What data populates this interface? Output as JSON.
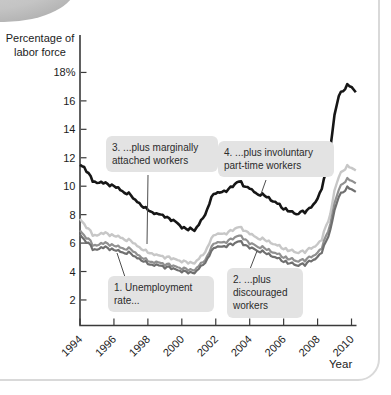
{
  "figure": {
    "kind": "textbook-line-chart"
  },
  "chart_data": {
    "type": "line",
    "title": "",
    "ylabel": "Percentage of labor force",
    "xlabel": "Year",
    "xlim": [
      1994,
      2010.5
    ],
    "ylim": [
      0,
      19
    ],
    "grid": false,
    "legend_position": "annotated-callouts",
    "x_ticks": [
      1994,
      1996,
      1998,
      2000,
      2002,
      2004,
      2006,
      2008,
      2010
    ],
    "x_tick_labels": [
      "1994",
      "1996",
      "1998",
      "2000",
      "2002",
      "2004",
      "2006",
      "2008",
      "2010"
    ],
    "y_ticks": [
      2,
      4,
      6,
      8,
      10,
      12,
      14,
      16,
      18
    ],
    "y_tick_labels": [
      "2",
      "4",
      "6",
      "8",
      "10",
      "12",
      "14",
      "16",
      "18%"
    ],
    "x": [
      1994.0,
      1994.25,
      1994.5,
      1994.75,
      1995.0,
      1995.25,
      1995.5,
      1995.75,
      1996.0,
      1996.25,
      1996.5,
      1996.75,
      1997.0,
      1997.25,
      1997.5,
      1997.75,
      1998.0,
      1998.25,
      1998.5,
      1998.75,
      1999.0,
      1999.25,
      1999.5,
      1999.75,
      2000.0,
      2000.25,
      2000.5,
      2000.75,
      2001.0,
      2001.25,
      2001.5,
      2001.75,
      2002.0,
      2002.25,
      2002.5,
      2002.75,
      2003.0,
      2003.25,
      2003.5,
      2003.75,
      2004.0,
      2004.25,
      2004.5,
      2004.75,
      2005.0,
      2005.25,
      2005.5,
      2005.75,
      2006.0,
      2006.25,
      2006.5,
      2006.75,
      2007.0,
      2007.25,
      2007.5,
      2007.75,
      2008.0,
      2008.25,
      2008.5,
      2008.75,
      2009.0,
      2009.25,
      2009.5,
      2009.75,
      2010.0,
      2010.25
    ],
    "series": [
      {
        "name": "1. Unemployment rate...",
        "color": "#6f6f6f",
        "values": [
          6.6,
          6.2,
          6.0,
          5.6,
          5.5,
          5.7,
          5.7,
          5.6,
          5.5,
          5.5,
          5.3,
          5.3,
          5.3,
          5.0,
          4.9,
          4.7,
          4.6,
          4.4,
          4.5,
          4.4,
          4.3,
          4.3,
          4.2,
          4.1,
          4.0,
          4.0,
          3.9,
          3.9,
          4.2,
          4.5,
          4.8,
          5.5,
          5.7,
          5.8,
          5.7,
          5.9,
          5.9,
          6.1,
          6.1,
          5.8,
          5.7,
          5.6,
          5.4,
          5.4,
          5.3,
          5.1,
          5.0,
          4.9,
          4.7,
          4.6,
          4.6,
          4.4,
          4.5,
          4.5,
          4.7,
          4.8,
          5.0,
          5.4,
          6.1,
          6.9,
          8.3,
          9.3,
          9.6,
          9.9,
          9.8,
          9.6
        ]
      },
      {
        "name": "2. ...plus discouraged workers",
        "color": "#909090",
        "values": [
          6.9,
          6.5,
          6.3,
          5.9,
          5.8,
          6.0,
          6.0,
          5.9,
          5.8,
          5.8,
          5.6,
          5.6,
          5.6,
          5.3,
          5.1,
          4.9,
          4.8,
          4.6,
          4.7,
          4.6,
          4.5,
          4.5,
          4.4,
          4.3,
          4.2,
          4.2,
          4.1,
          4.1,
          4.4,
          4.7,
          5.0,
          5.8,
          6.0,
          6.1,
          6.0,
          6.2,
          6.3,
          6.5,
          6.5,
          6.2,
          6.0,
          5.9,
          5.7,
          5.7,
          5.6,
          5.4,
          5.3,
          5.2,
          5.0,
          4.9,
          4.9,
          4.7,
          4.8,
          4.8,
          5.0,
          5.1,
          5.3,
          5.7,
          6.5,
          7.3,
          8.8,
          9.8,
          10.2,
          10.5,
          10.4,
          10.2
        ]
      },
      {
        "name": "3. ...plus marginally attached workers",
        "color": "#c7c7c7",
        "values": [
          7.7,
          7.3,
          7.0,
          6.6,
          6.5,
          6.7,
          6.7,
          6.6,
          6.5,
          6.5,
          6.3,
          6.2,
          6.2,
          5.9,
          5.7,
          5.5,
          5.4,
          5.2,
          5.2,
          5.1,
          5.0,
          5.0,
          4.9,
          4.8,
          4.7,
          4.7,
          4.6,
          4.6,
          4.9,
          5.2,
          5.6,
          6.4,
          6.6,
          6.7,
          6.6,
          6.8,
          6.9,
          7.1,
          7.1,
          6.8,
          6.7,
          6.5,
          6.3,
          6.3,
          6.2,
          6.0,
          5.9,
          5.8,
          5.6,
          5.5,
          5.5,
          5.3,
          5.4,
          5.4,
          5.6,
          5.7,
          5.9,
          6.3,
          7.2,
          8.0,
          9.7,
          10.7,
          11.1,
          11.4,
          11.3,
          11.1
        ]
      },
      {
        "name": "4. ...plus involuntary part-time workers",
        "color": "#161616",
        "values": [
          11.5,
          11.3,
          10.9,
          10.4,
          10.2,
          10.3,
          10.2,
          10.1,
          10.0,
          9.9,
          9.6,
          9.5,
          9.4,
          9.0,
          8.8,
          8.5,
          8.4,
          8.1,
          8.1,
          8.0,
          7.9,
          7.7,
          7.6,
          7.4,
          7.1,
          7.0,
          7.0,
          6.9,
          7.3,
          7.8,
          8.3,
          9.3,
          9.5,
          9.6,
          9.6,
          9.8,
          10.0,
          10.3,
          10.3,
          9.9,
          9.9,
          9.6,
          9.4,
          9.4,
          9.3,
          9.0,
          8.9,
          8.7,
          8.4,
          8.3,
          8.2,
          8.0,
          8.2,
          8.2,
          8.4,
          8.7,
          9.1,
          9.9,
          11.0,
          12.6,
          15.0,
          16.4,
          16.7,
          17.1,
          17.0,
          16.6
        ]
      }
    ]
  }
}
